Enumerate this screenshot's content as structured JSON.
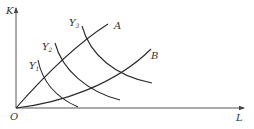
{
  "diagram": {
    "type": "isoquant-expansion-path",
    "axes": {
      "x": {
        "label": "L"
      },
      "y": {
        "label": "K"
      },
      "origin": {
        "label": "O"
      }
    },
    "rays": [
      {
        "id": "A",
        "label": "A"
      },
      {
        "id": "B",
        "label": "B"
      }
    ],
    "isoquants": [
      {
        "id": "Y1",
        "base": "Y",
        "sub": "1"
      },
      {
        "id": "Y2",
        "base": "Y",
        "sub": "2"
      },
      {
        "id": "Y3",
        "base": "Y",
        "sub": "3"
      }
    ],
    "colors": {
      "line": "#2a2a2a",
      "axis": "#444444",
      "text": "#333333",
      "background": "#ffffff"
    }
  }
}
